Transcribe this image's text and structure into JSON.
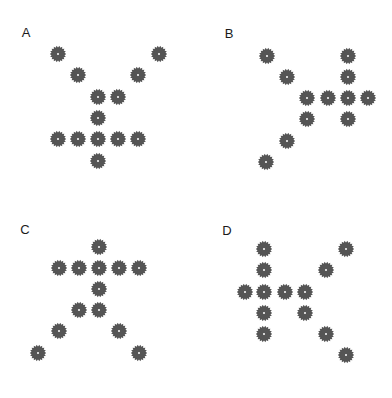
{
  "gear_color": "#555555",
  "panels": [
    {
      "label": "A",
      "label_pos": [
        26,
        32
      ],
      "gears": [
        [
          58,
          54
        ],
        [
          159,
          54
        ],
        [
          78,
          75
        ],
        [
          138,
          75
        ],
        [
          98,
          97
        ],
        [
          118,
          97
        ],
        [
          98,
          118
        ],
        [
          58,
          139
        ],
        [
          78,
          139
        ],
        [
          98,
          139
        ],
        [
          118,
          139
        ],
        [
          138,
          139
        ],
        [
          98,
          161
        ]
      ]
    },
    {
      "label": "B",
      "label_pos": [
        229,
        33
      ],
      "gears": [
        [
          267,
          56
        ],
        [
          348,
          56
        ],
        [
          287,
          77
        ],
        [
          348,
          77
        ],
        [
          307,
          98
        ],
        [
          328,
          98
        ],
        [
          348,
          98
        ],
        [
          368,
          98
        ],
        [
          307,
          119
        ],
        [
          348,
          119
        ],
        [
          287,
          141
        ],
        [
          266,
          162
        ]
      ]
    },
    {
      "label": "C",
      "label_pos": [
        25,
        229
      ],
      "gears": [
        [
          99,
          247
        ],
        [
          59,
          268
        ],
        [
          79,
          268
        ],
        [
          99,
          268
        ],
        [
          119,
          268
        ],
        [
          139,
          268
        ],
        [
          99,
          289
        ],
        [
          79,
          310
        ],
        [
          99,
          310
        ],
        [
          59,
          331
        ],
        [
          119,
          331
        ],
        [
          38,
          353
        ],
        [
          139,
          353
        ]
      ]
    },
    {
      "label": "D",
      "label_pos": [
        227,
        230
      ],
      "gears": [
        [
          264,
          249
        ],
        [
          346,
          249
        ],
        [
          264,
          270
        ],
        [
          326,
          270
        ],
        [
          245,
          292
        ],
        [
          264,
          292
        ],
        [
          285,
          292
        ],
        [
          305,
          292
        ],
        [
          264,
          313
        ],
        [
          305,
          313
        ],
        [
          264,
          334
        ],
        [
          326,
          334
        ],
        [
          346,
          355
        ]
      ]
    }
  ]
}
